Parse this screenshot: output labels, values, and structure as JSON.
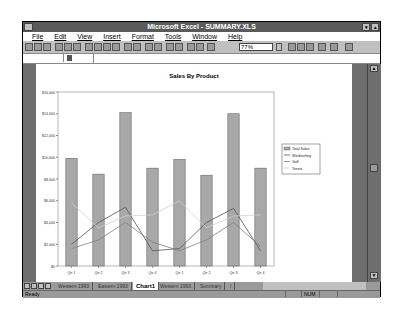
{
  "window": {
    "title": "Microsoft Excel - SUMMARY.XLS"
  },
  "menu": {
    "items": [
      {
        "label": "File"
      },
      {
        "label": "Edit"
      },
      {
        "label": "View"
      },
      {
        "label": "Insert"
      },
      {
        "label": "Format"
      },
      {
        "label": "Tools"
      },
      {
        "label": "Window"
      },
      {
        "label": "Help"
      }
    ]
  },
  "toolbar": {
    "zoom_value": "77%",
    "buttons": [
      "new-icon",
      "open-icon",
      "save-icon",
      "print-icon",
      "print-preview-icon",
      "spelling-icon",
      "cut-icon",
      "copy-icon",
      "paste-icon",
      "format-painter-icon",
      "undo-icon",
      "redo-icon",
      "autosum-icon",
      "function-wizard-icon",
      "sort-ascending-icon",
      "sort-descending-icon",
      "chart-wizard-icon",
      "text-box-icon",
      "drawing-icon",
      "zoom-dropdown-icon",
      "tip-wizard-icon",
      "help-icon",
      "chart-type-icon",
      "default-chart-icon",
      "legend-icon",
      "gridlines-icon"
    ]
  },
  "sheet_tabs": {
    "items": [
      {
        "label": "Western 1993"
      },
      {
        "label": "Eastern 1993"
      },
      {
        "label": "Chart1",
        "active": true
      },
      {
        "label": "Western 1993"
      },
      {
        "label": "Summary"
      },
      {
        "label": "/"
      }
    ]
  },
  "status": {
    "text": "Ready",
    "num": "NUM"
  },
  "chart_data": {
    "type": "bar",
    "title": "Sales By Product",
    "categories": [
      "Qtr 1",
      "Qtr 2",
      "Qtr 3",
      "Qtr 4",
      "Qtr 1",
      "Qtr 2",
      "Qtr 3",
      "Qtr 4"
    ],
    "series": [
      {
        "name": "Total Sales",
        "kind": "bar",
        "color": "#a8a8a8",
        "values": [
          9900,
          8450,
          14100,
          9000,
          9800,
          8350,
          14000,
          9000
        ]
      },
      {
        "name": "Windsurfing",
        "kind": "line",
        "color": "#555555",
        "values": [
          2000,
          4000,
          5400,
          1400,
          1600,
          4000,
          5300,
          1400
        ]
      },
      {
        "name": "Golf",
        "kind": "line",
        "color": "#808080",
        "values": [
          1600,
          2400,
          4000,
          2200,
          1400,
          2400,
          4000,
          1800
        ]
      },
      {
        "name": "Tennis",
        "kind": "line",
        "color": "#d0d0d0",
        "values": [
          5800,
          3500,
          4600,
          4700,
          6000,
          3500,
          4600,
          4700
        ]
      }
    ],
    "yticks": [
      "$0",
      "$2,000",
      "$4,000",
      "$6,000",
      "$8,000",
      "$10,000",
      "$12,000",
      "$14,000",
      "$16,000"
    ],
    "ylim": [
      0,
      16000
    ],
    "xlabel": "",
    "ylabel": "",
    "grid": false,
    "legend_position": "right"
  }
}
